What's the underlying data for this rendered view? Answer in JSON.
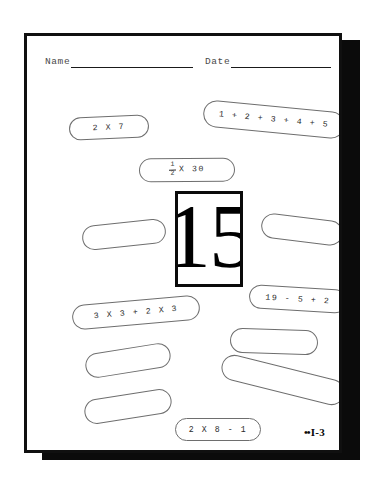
{
  "document": {
    "type": "math-worksheet",
    "page_code": "I-3",
    "page_code_dots": "••",
    "answer_box": {
      "value": "15"
    },
    "header": {
      "name_label": "Name",
      "date_label": "Date",
      "name_value": "",
      "date_value": ""
    },
    "ovals": [
      {
        "id": "oval-2x7",
        "text": "2  X  7",
        "empty": false,
        "left": 42,
        "top": 80,
        "width": 80,
        "height": 23,
        "rotate": -2.5
      },
      {
        "id": "oval-sum-1to5",
        "text": "1 + 2 + 3 + 4 + 5",
        "empty": false,
        "left": 176,
        "top": 70,
        "width": 142,
        "height": 27,
        "rotate": 5.5
      },
      {
        "id": "oval-half-x30",
        "text": "",
        "empty": false,
        "left": 112,
        "top": 122,
        "width": 96,
        "height": 24,
        "rotate": -0.5,
        "fraction": {
          "numerator": "1",
          "denominator": "2",
          "suffix": "X 30"
        }
      },
      {
        "id": "oval-blank-1",
        "text": "",
        "empty": true,
        "left": 55,
        "top": 186,
        "width": 84,
        "height": 25,
        "rotate": -6
      },
      {
        "id": "oval-blank-2",
        "text": "",
        "empty": true,
        "left": 234,
        "top": 181,
        "width": 82,
        "height": 25,
        "rotate": 7
      },
      {
        "id": "oval-3x3-2x3",
        "text": "3 X 3 + 2 X 3",
        "empty": false,
        "left": 45,
        "top": 264,
        "width": 128,
        "height": 25,
        "rotate": -5
      },
      {
        "id": "oval-19-5-2",
        "text": "19 - 5 + 2",
        "empty": false,
        "left": 222,
        "top": 251,
        "width": 98,
        "height": 24,
        "rotate": 3.5
      },
      {
        "id": "oval-blank-3",
        "text": "",
        "empty": true,
        "left": 58,
        "top": 312,
        "width": 86,
        "height": 25,
        "rotate": -9
      },
      {
        "id": "oval-blank-4",
        "text": "",
        "empty": true,
        "left": 203,
        "top": 293,
        "width": 88,
        "height": 25,
        "rotate": 2
      },
      {
        "id": "oval-blank-5",
        "text": "",
        "empty": true,
        "left": 57,
        "top": 358,
        "width": 88,
        "height": 25,
        "rotate": -9
      },
      {
        "id": "oval-blank-6",
        "text": "",
        "empty": true,
        "left": 193,
        "top": 331,
        "width": 126,
        "height": 26,
        "rotate": 14
      },
      {
        "id": "oval-2x8-1",
        "text": "2 X 8 - 1",
        "empty": false,
        "left": 148,
        "top": 382,
        "width": 86,
        "height": 23,
        "rotate": 0
      },
      {
        "id": "oval-blank-7",
        "text": "",
        "empty": true,
        "left": 148,
        "top": 419,
        "width": 80,
        "height": 24,
        "rotate": 0
      }
    ]
  }
}
